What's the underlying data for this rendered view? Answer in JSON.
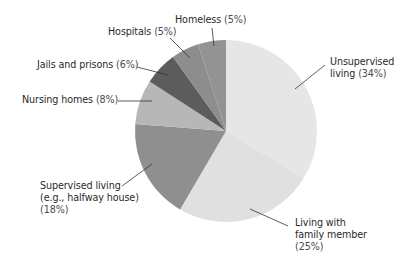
{
  "chart_data": {
    "type": "pie",
    "title": "",
    "start_angle_deg": 0,
    "direction": "clockwise",
    "center": [
      226,
      131
    ],
    "radius": 91,
    "slices": [
      {
        "label": "Unsupervised living",
        "value": 34,
        "display": "Unsupervised living (34%)",
        "color": "#e6e6e6"
      },
      {
        "label": "Living with family member",
        "value": 25,
        "display": "Living with family member (25%)",
        "color": "#e0e0e0"
      },
      {
        "label": "Supervised living (e.g., halfway house)",
        "value": 18,
        "display": "Supervised living (e.g., halfway house) (18%)",
        "color": "#8f8f8f"
      },
      {
        "label": "Nursing homes",
        "value": 8,
        "display": "Nursing homes (8%)",
        "color": "#b7b7b7"
      },
      {
        "label": "Jails and prisons",
        "value": 6,
        "display": "Jails and prisons (6%)",
        "color": "#5c5c5c"
      },
      {
        "label": "Hospitals",
        "value": 5,
        "display": "Hospitals (5%)",
        "color": "#8d8d8d"
      },
      {
        "label": "Homeless",
        "value": 5,
        "display": "Homeless (5%)",
        "color": "#939393"
      }
    ]
  },
  "labels": {
    "unsupervised": {
      "line1": "Unsupervised",
      "line2": "living ",
      "pct": "(34%)"
    },
    "family": {
      "line1": "Living with",
      "line2": "family member",
      "pct": "(25%)"
    },
    "supervised": {
      "line1": "Supervised living",
      "line2": "(e.g., halfway house)",
      "pct": "(18%)"
    },
    "nursing": {
      "text": "Nursing homes ",
      "pct": "(8%)"
    },
    "jails": {
      "text": "Jails and prisons ",
      "pct": "(6%)"
    },
    "hospitals": {
      "text": "Hospitals ",
      "pct": "(5%)"
    },
    "homeless": {
      "text": "Homeless ",
      "pct": "(5%)"
    }
  }
}
